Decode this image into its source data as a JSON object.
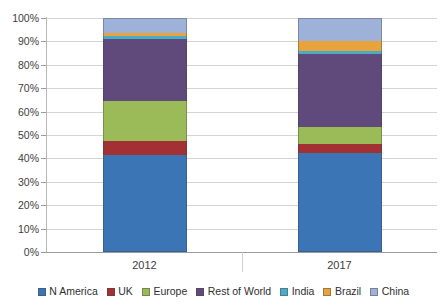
{
  "chart_data": {
    "type": "bar",
    "subtype": "stacked-100-percent",
    "title": "",
    "xlabel": "",
    "ylabel": "",
    "categories": [
      "2012",
      "2017"
    ],
    "ylim": [
      0,
      100
    ],
    "ytick_labels": [
      "0%",
      "10%",
      "20%",
      "30%",
      "40%",
      "50%",
      "60%",
      "70%",
      "80%",
      "90%",
      "100%"
    ],
    "ytick_values": [
      0,
      10,
      20,
      30,
      40,
      50,
      60,
      70,
      80,
      90,
      100
    ],
    "grid": true,
    "legend_position": "bottom",
    "units": "percent",
    "series": [
      {
        "name": "N America",
        "color": "#3b75b5",
        "values": [
          41.5,
          42.5
        ]
      },
      {
        "name": "UK",
        "color": "#a33033",
        "values": [
          6.0,
          3.5
        ]
      },
      {
        "name": "Europe",
        "color": "#9bbb59",
        "values": [
          17.0,
          7.5
        ]
      },
      {
        "name": "Rest of World",
        "color": "#604a7b",
        "values": [
          26.5,
          31.0
        ]
      },
      {
        "name": "India",
        "color": "#4bacc6",
        "values": [
          1.3,
          1.5
        ]
      },
      {
        "name": "Brazil",
        "color": "#e8a33d",
        "values": [
          1.2,
          4.0
        ]
      },
      {
        "name": "China",
        "color": "#9eb1d8",
        "values": [
          6.5,
          10.0
        ]
      }
    ],
    "cumulative_tops": {
      "2012": [
        41.5,
        47.5,
        64.5,
        91.0,
        92.3,
        93.5,
        100.0
      ],
      "2017": [
        42.5,
        46.0,
        53.5,
        84.5,
        86.0,
        90.0,
        100.0
      ]
    }
  },
  "legend": {
    "items": [
      {
        "label": "N America",
        "color": "#3b75b5"
      },
      {
        "label": "UK",
        "color": "#a33033"
      },
      {
        "label": "Europe",
        "color": "#9bbb59"
      },
      {
        "label": "Rest of World",
        "color": "#604a7b"
      },
      {
        "label": "India",
        "color": "#4bacc6"
      },
      {
        "label": "Brazil",
        "color": "#e8a33d"
      },
      {
        "label": "China",
        "color": "#9eb1d8"
      }
    ]
  },
  "axis": {
    "y_labels": [
      "100%",
      "90%",
      "80%",
      "70%",
      "60%",
      "50%",
      "40%",
      "30%",
      "20%",
      "10%",
      "0%"
    ],
    "x_labels": [
      "2012",
      "2017"
    ]
  }
}
